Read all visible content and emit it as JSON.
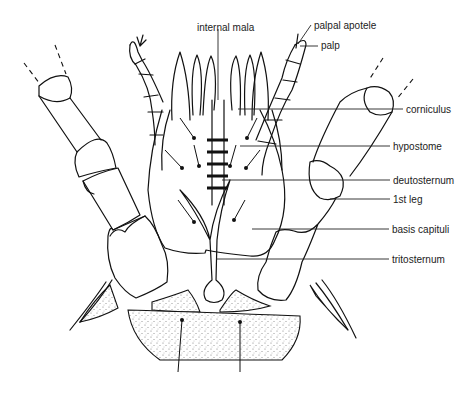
{
  "figure": {
    "labels": [
      {
        "id": "internal-mala",
        "text": "internal mala",
        "x": 197,
        "y": 22
      },
      {
        "id": "palpal-apotele",
        "text": "palpal apotele",
        "x": 314,
        "y": 20
      },
      {
        "id": "palp",
        "text": "palp",
        "x": 321,
        "y": 40
      },
      {
        "id": "corniculus",
        "text": "corniculus",
        "x": 406,
        "y": 104
      },
      {
        "id": "hypostome",
        "text": "hypostome",
        "x": 393,
        "y": 141
      },
      {
        "id": "deutosternum",
        "text": "deutosternum",
        "x": 393,
        "y": 175
      },
      {
        "id": "first-leg",
        "text": "1st leg",
        "x": 393,
        "y": 194
      },
      {
        "id": "basis-capituli",
        "text": "basis capituli",
        "x": 392,
        "y": 224
      },
      {
        "id": "tritosternum",
        "text": "tritosternum",
        "x": 392,
        "y": 254
      }
    ]
  }
}
